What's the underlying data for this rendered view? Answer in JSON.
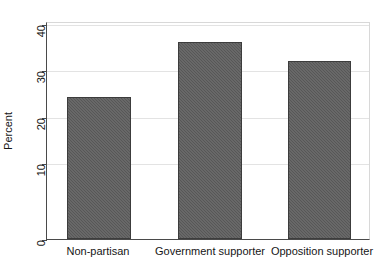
{
  "chart_data": {
    "type": "bar",
    "title": "",
    "xlabel": "",
    "ylabel": "Percent",
    "categories": [
      "Non-partisan",
      "Government supporter",
      "Opposition supporter"
    ],
    "values": [
      27.7,
      38.4,
      34.7
    ],
    "ylim": [
      0,
      42
    ],
    "yticks": [
      0,
      10,
      20,
      30,
      40
    ],
    "ytick_labels": [
      "0",
      "10",
      "20",
      "30",
      "40"
    ],
    "grid": true,
    "grid_axis": "y",
    "legend": "none",
    "bar_color": "#575757",
    "bar_edge_color": "#3c3c3c",
    "axis_color": "#4a4a4a",
    "grid_color": "#e3e3e3",
    "background": "#ffffff"
  },
  "axis": {
    "y_title": "Percent",
    "ticks": [
      {
        "label": "40",
        "value": 40
      },
      {
        "label": "30",
        "value": 30
      },
      {
        "label": "20",
        "value": 20
      },
      {
        "label": "10",
        "value": 10
      },
      {
        "label": "0",
        "value": 0
      }
    ]
  },
  "bars": [
    {
      "label": "Non-partisan",
      "value": 27.7
    },
    {
      "label": "Government supporter",
      "value": 38.4
    },
    {
      "label": "Opposition supporter",
      "value": 34.7
    }
  ]
}
